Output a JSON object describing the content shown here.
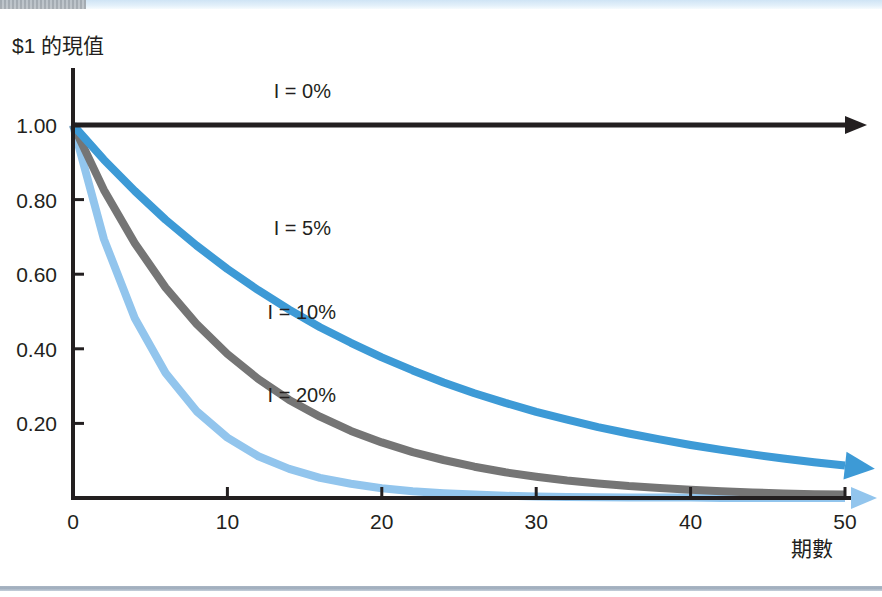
{
  "page": {
    "background_color": "#ffffff",
    "top_band_color": "#cfe4f5",
    "bottom_rule_color": "#9fadbd"
  },
  "chart_data": {
    "type": "line",
    "title": "",
    "ylabel": "$1 的現值",
    "xlabel": "期數",
    "xlim": [
      0,
      50
    ],
    "ylim": [
      0,
      1.0
    ],
    "grid": false,
    "legend_position": "inline-annotations",
    "x_ticks": [
      "0",
      "10",
      "20",
      "30",
      "40",
      "50"
    ],
    "x_tick_values": [
      0,
      10,
      20,
      30,
      40,
      50
    ],
    "y_ticks": [
      "1.00",
      "0.80",
      "0.60",
      "0.40",
      "0.20"
    ],
    "y_tick_values": [
      1.0,
      0.8,
      0.6,
      0.4,
      0.2
    ],
    "x": [
      0,
      2,
      4,
      6,
      8,
      10,
      12,
      14,
      16,
      18,
      20,
      22,
      24,
      26,
      28,
      30,
      32,
      34,
      36,
      38,
      40,
      42,
      44,
      46,
      48,
      50
    ],
    "series": [
      {
        "name": "I = 0%",
        "rate": 0.0,
        "color": "#231f20",
        "width": 5,
        "arrow": true,
        "label_x": 13,
        "label_y": 1.09,
        "values": [
          1.0,
          1.0,
          1.0,
          1.0,
          1.0,
          1.0,
          1.0,
          1.0,
          1.0,
          1.0,
          1.0,
          1.0,
          1.0,
          1.0,
          1.0,
          1.0,
          1.0,
          1.0,
          1.0,
          1.0,
          1.0,
          1.0,
          1.0,
          1.0,
          1.0,
          1.0
        ]
      },
      {
        "name": "I = 5%",
        "rate": 0.05,
        "color": "#3d9ad6",
        "width": 8,
        "arrow": true,
        "label_x": 13,
        "label_y": 0.725,
        "values": [
          1.0,
          0.907,
          0.823,
          0.746,
          0.677,
          0.614,
          0.557,
          0.505,
          0.458,
          0.416,
          0.377,
          0.342,
          0.31,
          0.281,
          0.255,
          0.231,
          0.21,
          0.19,
          0.173,
          0.157,
          0.142,
          0.129,
          0.117,
          0.106,
          0.096,
          0.087
        ]
      },
      {
        "name": "I = 10%",
        "rate": 0.1,
        "color": "#757575",
        "width": 8,
        "arrow": false,
        "label_x": 12.6,
        "label_y": 0.5,
        "values": [
          1.0,
          0.826,
          0.683,
          0.564,
          0.467,
          0.386,
          0.319,
          0.263,
          0.218,
          0.18,
          0.149,
          0.123,
          0.102,
          0.084,
          0.069,
          0.057,
          0.047,
          0.039,
          0.032,
          0.027,
          0.022,
          0.018,
          0.015,
          0.012,
          0.01,
          0.009
        ]
      },
      {
        "name": "I = 20%",
        "rate": 0.2,
        "color": "#92c5ed",
        "width": 8,
        "arrow": true,
        "label_x": 12.6,
        "label_y": 0.275,
        "values": [
          1.0,
          0.694,
          0.482,
          0.335,
          0.233,
          0.162,
          0.112,
          0.078,
          0.054,
          0.038,
          0.026,
          0.018,
          0.013,
          0.009,
          0.006,
          0.004,
          0.003,
          0.002,
          0.001,
          0.001,
          0.001,
          0.0,
          0.0,
          0.0,
          0.0,
          0.0
        ]
      }
    ]
  }
}
